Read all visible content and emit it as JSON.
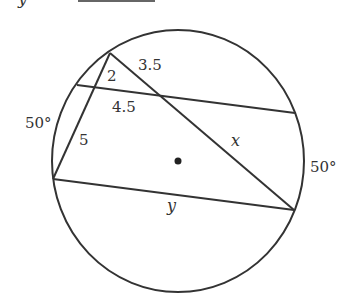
{
  "header": {
    "variable": "y",
    "equals": "=",
    "answer_blank": ""
  },
  "diagram": {
    "stroke_color": "#333333",
    "labels": {
      "seg_top_right": "3.5",
      "seg_top_left": "2",
      "seg_middle": "4.5",
      "seg_left": "5",
      "arc_left": "50°",
      "arc_right": "50°",
      "var_x": "x",
      "var_y": "y"
    }
  }
}
